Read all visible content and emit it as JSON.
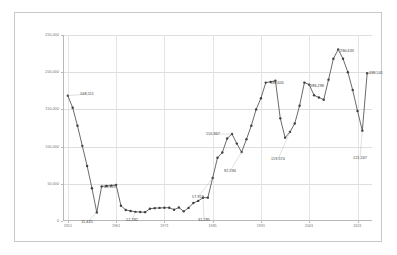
{
  "chart_data": {
    "type": "line",
    "title": "",
    "subtitle": "",
    "xlabel": "",
    "ylabel": "",
    "grid": true,
    "legend": "none",
    "ylim": [
      0,
      250000
    ],
    "yticks": [
      0,
      50000,
      100000,
      150000,
      200000,
      250000
    ],
    "ytick_labels": [
      "0",
      "50,000",
      "100,000",
      "150,000",
      "200,000",
      "250,000"
    ],
    "xtick_labels": [
      "1951",
      "1961",
      "1971",
      "1981",
      "1991",
      "2001",
      "2011"
    ],
    "xtick_values": [
      1951,
      1961,
      1971,
      1981,
      1991,
      2001,
      2011
    ],
    "xlim": [
      1950,
      2014
    ],
    "series_name": "",
    "line_color": "#595959",
    "marker_color": "#404040",
    "x": [
      1951,
      1952,
      1953,
      1954,
      1955,
      1956,
      1957,
      1958,
      1959,
      1960,
      1961,
      1962,
      1963,
      1964,
      1965,
      1966,
      1967,
      1968,
      1969,
      1970,
      1971,
      1972,
      1973,
      1974,
      1975,
      1976,
      1977,
      1978,
      1979,
      1980,
      1981,
      1982,
      1983,
      1984,
      1985,
      1986,
      1987,
      1988,
      1989,
      1990,
      1991,
      1992,
      1993,
      1994,
      1995,
      1996,
      1997,
      1998,
      1999,
      2000,
      2001,
      2002,
      2003,
      2004,
      2005,
      2006,
      2007,
      2008,
      2009,
      2010,
      2011,
      2012,
      2013
    ],
    "values": [
      168511,
      152300,
      128000,
      101000,
      74000,
      44000,
      11445,
      46500,
      47200,
      47500,
      48619,
      20500,
      14800,
      13400,
      12282,
      12100,
      11900,
      16500,
      17300,
      17600,
      17800,
      17900,
      15200,
      18100,
      13000,
      17600,
      24200,
      27000,
      31295,
      31400,
      57913,
      85000,
      92000,
      110947,
      116947,
      104000,
      92594,
      110000,
      128000,
      150000,
      165000,
      186000,
      187000,
      188605,
      138000,
      112000,
      119574,
      131000,
      155000,
      186000,
      183298,
      169000,
      166000,
      163000,
      190000,
      218000,
      230633,
      218000,
      200000,
      176000,
      148000,
      121267,
      198541
    ],
    "labeled_points": [
      {
        "x": 1951,
        "value": 168511,
        "label": "168,511",
        "lx": 72,
        "ly": 81
      },
      {
        "x": 1957,
        "value": 11445,
        "label": "11,445",
        "lx": 72,
        "ly": 209
      },
      {
        "x": 1961,
        "value": 48619,
        "label": "48,619",
        "lx": 95,
        "ly": 174
      },
      {
        "x": 1965,
        "value": 12282,
        "label": "12,282",
        "lx": 117,
        "ly": 207
      },
      {
        "x": 1979,
        "value": 31295,
        "label": "31,295",
        "lx": 189,
        "ly": 207
      },
      {
        "x": 1981,
        "value": 57913,
        "label": "57,913",
        "lx": 183,
        "ly": 184
      },
      {
        "x": 1985,
        "value": 116947,
        "label": "116,947",
        "lx": 198,
        "ly": 121
      },
      {
        "x": 1987,
        "value": 92594,
        "label": "92,594",
        "lx": 215,
        "ly": 158
      },
      {
        "x": 1994,
        "value": 188605,
        "label": "188,605",
        "lx": 262,
        "ly": 70
      },
      {
        "x": 1997,
        "value": 119574,
        "label": "119,574",
        "lx": 263,
        "ly": 146
      },
      {
        "x": 2001,
        "value": 183298,
        "label": "183,298",
        "lx": 302,
        "ly": 73
      },
      {
        "x": 2007,
        "value": 230633,
        "label": "230,633",
        "lx": 332,
        "ly": 38
      },
      {
        "x": 2012,
        "value": 121267,
        "label": "121,267",
        "lx": 345,
        "ly": 145
      },
      {
        "x": 2013,
        "value": 198541,
        "label": "198,541",
        "lx": 361,
        "ly": 60
      }
    ]
  }
}
